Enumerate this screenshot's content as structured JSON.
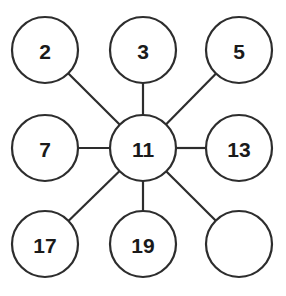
{
  "diagram": {
    "type": "hub-and-spoke",
    "canvas": {
      "width": 286,
      "height": 296,
      "background": "#ffffff"
    },
    "style": {
      "stroke_color": "#2d2d2d",
      "stroke_width": 2.2,
      "node_fill": "#ffffff",
      "label_color": "#1a1a1a",
      "node_radius": 33
    },
    "hub_id": "center",
    "nodes": [
      {
        "id": "top-left",
        "label": "2",
        "cx": 45,
        "cy": 50,
        "r": 33,
        "empty": false
      },
      {
        "id": "top-center",
        "label": "3",
        "cx": 143,
        "cy": 50,
        "r": 33,
        "empty": false
      },
      {
        "id": "top-right",
        "label": "5",
        "cx": 239,
        "cy": 50,
        "r": 33,
        "empty": false
      },
      {
        "id": "middle-left",
        "label": "7",
        "cx": 45,
        "cy": 148,
        "r": 33,
        "empty": false
      },
      {
        "id": "center",
        "label": "11",
        "cx": 143,
        "cy": 148,
        "r": 33,
        "empty": false
      },
      {
        "id": "middle-right",
        "label": "13",
        "cx": 239,
        "cy": 148,
        "r": 33,
        "empty": false
      },
      {
        "id": "bottom-left",
        "label": "17",
        "cx": 45,
        "cy": 244,
        "r": 33,
        "empty": false
      },
      {
        "id": "bottom-center",
        "label": "19",
        "cx": 143,
        "cy": 244,
        "r": 33,
        "empty": false
      },
      {
        "id": "bottom-right",
        "label": "",
        "cx": 239,
        "cy": 244,
        "r": 33,
        "empty": true
      }
    ],
    "edges": [
      {
        "from": "center",
        "to": "top-left"
      },
      {
        "from": "center",
        "to": "top-center"
      },
      {
        "from": "center",
        "to": "top-right"
      },
      {
        "from": "center",
        "to": "middle-left"
      },
      {
        "from": "center",
        "to": "middle-right"
      },
      {
        "from": "center",
        "to": "bottom-left"
      },
      {
        "from": "center",
        "to": "bottom-center"
      },
      {
        "from": "center",
        "to": "bottom-right"
      }
    ]
  }
}
